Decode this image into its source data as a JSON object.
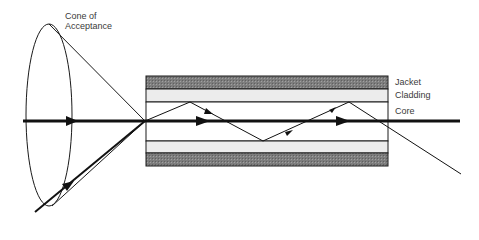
{
  "diagram": {
    "labels": {
      "cone_line1": "Cone of",
      "cone_line2": "Acceptance",
      "jacket": "Jacket",
      "cladding": "Cladding",
      "core": "Core"
    },
    "colors": {
      "jacket": "#8a8a8a",
      "cladding": "#ececec",
      "core": "#ffffff",
      "line": "#1a1a1a"
    }
  }
}
